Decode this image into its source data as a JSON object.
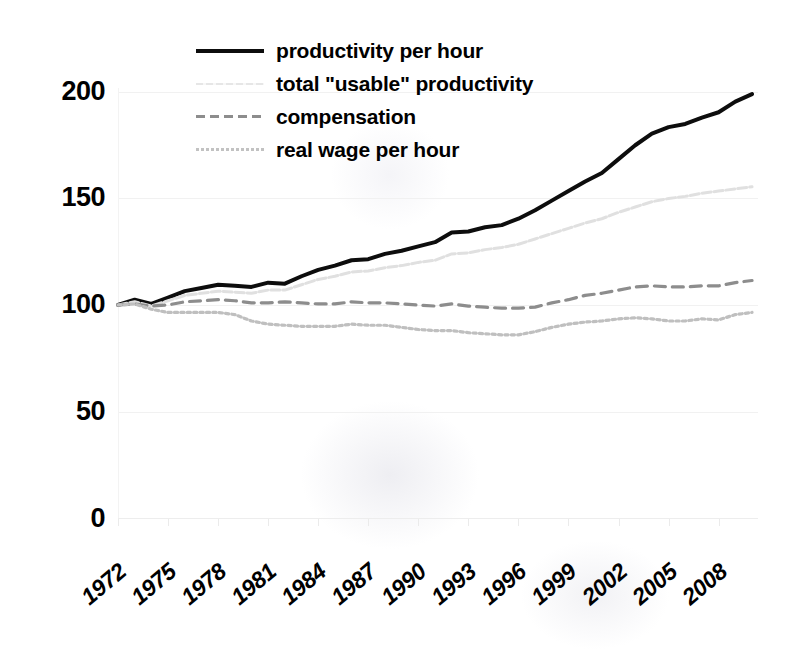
{
  "chart_data": {
    "type": "line",
    "title": "",
    "subtitle": "",
    "xlabel": "",
    "ylabel": "",
    "index_base_note": "index, 1972 = 100",
    "xlim": [
      1972,
      2010
    ],
    "ylim": [
      0,
      210
    ],
    "yticks": [
      0,
      50,
      100,
      150,
      200
    ],
    "ytick_labels": [
      "0",
      "50",
      "100",
      "150",
      "200"
    ],
    "xticks": [
      1972,
      1975,
      1978,
      1981,
      1984,
      1987,
      1990,
      1993,
      1996,
      1999,
      2002,
      2005,
      2008
    ],
    "xtick_labels": [
      "1972",
      "1975",
      "1978",
      "1981",
      "1984",
      "1987",
      "1990",
      "1993",
      "1996",
      "1999",
      "2002",
      "2005",
      "2008"
    ],
    "grid": "horizontal-faint",
    "legend_position": "top-center-inside",
    "x": [
      1972,
      1973,
      1974,
      1975,
      1976,
      1977,
      1978,
      1979,
      1980,
      1981,
      1982,
      1983,
      1984,
      1985,
      1986,
      1987,
      1988,
      1989,
      1990,
      1991,
      1992,
      1993,
      1994,
      1995,
      1996,
      1997,
      1998,
      1999,
      2000,
      2001,
      2002,
      2003,
      2004,
      2005,
      2006,
      2007,
      2008,
      2009,
      2010
    ],
    "series": [
      {
        "name": "productivity per hour",
        "style": "solid",
        "color": "#0d0d0d",
        "width": 4,
        "values": [
          100.0,
          102.5,
          100.5,
          103.5,
          106.5,
          108.0,
          109.5,
          109.0,
          108.5,
          110.5,
          110.0,
          113.5,
          116.5,
          118.5,
          121.0,
          121.5,
          124.0,
          125.5,
          127.5,
          129.5,
          134.0,
          134.5,
          136.5,
          137.5,
          140.5,
          144.5,
          149.0,
          153.5,
          158.0,
          162.0,
          168.5,
          175.0,
          180.5,
          183.5,
          185.0,
          188.0,
          190.5,
          195.5,
          199.0
        ]
      },
      {
        "name": "total \"usable\" productivity",
        "style": "faint",
        "color": "#e0e0e0",
        "width": 3,
        "values": [
          100.0,
          101.5,
          99.5,
          102.0,
          104.5,
          105.5,
          106.5,
          106.0,
          105.5,
          107.0,
          107.0,
          109.5,
          112.0,
          113.5,
          115.5,
          116.0,
          117.5,
          118.5,
          120.0,
          121.0,
          124.0,
          124.5,
          126.0,
          127.0,
          128.5,
          131.0,
          133.5,
          136.0,
          138.5,
          140.5,
          143.5,
          146.0,
          148.5,
          150.0,
          151.0,
          152.5,
          153.5,
          154.5,
          155.5
        ]
      },
      {
        "name": "compensation",
        "style": "dashed",
        "color": "#8d8d8d",
        "width": 3.2,
        "values": [
          100.0,
          100.5,
          99.5,
          100.0,
          101.5,
          102.0,
          102.5,
          102.0,
          101.0,
          101.0,
          101.5,
          101.0,
          100.5,
          100.5,
          101.5,
          101.0,
          101.0,
          100.5,
          100.0,
          99.5,
          100.5,
          99.5,
          99.0,
          98.5,
          98.5,
          99.0,
          101.0,
          102.5,
          104.5,
          105.5,
          107.0,
          108.5,
          109.0,
          108.5,
          108.5,
          109.0,
          109.0,
          110.5,
          111.5
        ]
      },
      {
        "name": "real wage per hour",
        "style": "dotted",
        "color": "#bfbfbf",
        "width": 3.2,
        "values": [
          100.0,
          100.5,
          98.0,
          96.5,
          96.5,
          96.5,
          96.5,
          95.5,
          92.5,
          91.0,
          90.5,
          90.0,
          90.0,
          90.0,
          91.0,
          90.5,
          90.5,
          89.5,
          88.5,
          88.0,
          88.0,
          87.0,
          86.5,
          86.0,
          86.0,
          87.5,
          89.5,
          91.0,
          92.0,
          92.5,
          93.5,
          94.0,
          93.5,
          92.5,
          92.5,
          93.5,
          93.0,
          95.5,
          96.5
        ]
      }
    ]
  },
  "legend": {
    "items": [
      {
        "label": "productivity per hour",
        "swatch": "solid-line-swatch"
      },
      {
        "label": "total \"usable\" productivity",
        "swatch": "faint-line-swatch"
      },
      {
        "label": "compensation",
        "swatch": "dashed-line-swatch"
      },
      {
        "label": "real wage per hour",
        "swatch": "dotted-line-swatch"
      }
    ]
  },
  "colors": {
    "productivity": "#0d0d0d",
    "usable_productivity": "#e0e0e0",
    "compensation": "#8d8d8d",
    "real_wage": "#bfbfbf",
    "background": "#ffffff",
    "text": "#000000",
    "gridline": "#f1f1f1"
  }
}
